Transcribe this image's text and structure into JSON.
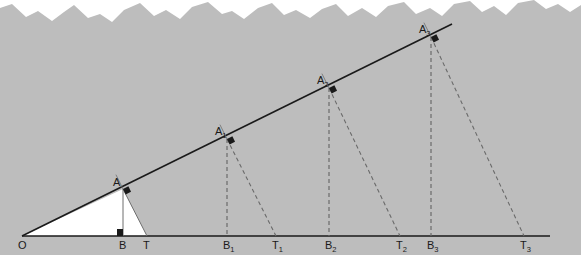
{
  "diagram": {
    "colors": {
      "background": "#bdbdbd",
      "paper_edge": "#ffffff",
      "triangle_fill": "#ffffff",
      "line": "#1a1a1a",
      "thin_line": "#6e6e6e",
      "dashed_line": "#6a6a6a"
    },
    "origin": {
      "label": "O",
      "x": 22,
      "y": 236
    },
    "baseline": {
      "x1": 22,
      "y1": 236,
      "x2": 550,
      "y2": 236
    },
    "ray": {
      "x1": 22,
      "y1": 236,
      "x2": 452,
      "y2": 24
    },
    "points": [
      {
        "name": "A",
        "base": "A",
        "sub": "",
        "x": 123,
        "y": 189,
        "label_dx": -10,
        "label_dy": -3
      },
      {
        "name": "A1",
        "base": "A",
        "sub": "1",
        "x": 227,
        "y": 139,
        "label_dx": -12,
        "label_dy": -4
      },
      {
        "name": "A2",
        "base": "A",
        "sub": "2",
        "x": 329,
        "y": 88,
        "label_dx": -12,
        "label_dy": -4
      },
      {
        "name": "A3",
        "base": "A",
        "sub": "3",
        "x": 431,
        "y": 37,
        "label_dx": -12,
        "label_dy": -4
      }
    ],
    "feet": [
      {
        "name": "B",
        "base": "B",
        "sub": "",
        "x": 123,
        "y": 236
      },
      {
        "name": "B1",
        "base": "B",
        "sub": "1",
        "x": 227,
        "y": 236
      },
      {
        "name": "B2",
        "base": "B",
        "sub": "2",
        "x": 329,
        "y": 236
      },
      {
        "name": "B3",
        "base": "B",
        "sub": "3",
        "x": 431,
        "y": 236
      }
    ],
    "tangent_points": [
      {
        "name": "T",
        "base": "T",
        "sub": "",
        "x": 147,
        "y": 236
      },
      {
        "name": "T1",
        "base": "T",
        "sub": "1",
        "x": 276,
        "y": 236
      },
      {
        "name": "T2",
        "base": "T",
        "sub": "2",
        "x": 400,
        "y": 236
      },
      {
        "name": "T3",
        "base": "T",
        "sub": "3",
        "x": 524,
        "y": 236
      }
    ],
    "labels": {
      "O": "O",
      "A": "A",
      "A1": "A",
      "A2": "A",
      "A3": "A",
      "A1_sub": "1",
      "A2_sub": "2",
      "A3_sub": "3",
      "B": "B",
      "B1": "B",
      "B2": "B",
      "B3": "B",
      "B1_sub": "1",
      "B2_sub": "2",
      "B3_sub": "3",
      "T": "T",
      "T1": "T",
      "T2": "T",
      "T3": "T",
      "T1_sub": "1",
      "T2_sub": "2",
      "T3_sub": "3"
    }
  }
}
